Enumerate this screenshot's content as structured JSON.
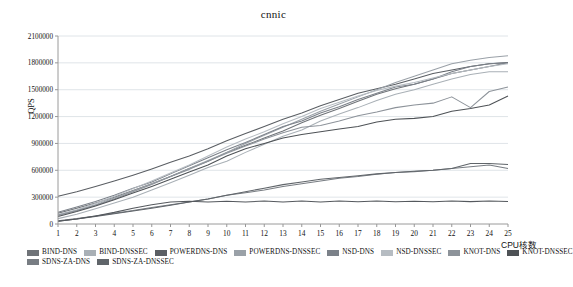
{
  "page": {
    "clipped_header_text": "",
    "background": "#ffffff"
  },
  "chart_data": {
    "type": "line",
    "title": "cnnic",
    "xlabel": "CPU核数",
    "ylabel": "QPS",
    "xlim": [
      1,
      25
    ],
    "ylim": [
      0,
      2100000
    ],
    "ytick_step": 300000,
    "yticks": [
      0,
      300000,
      600000,
      900000,
      1200000,
      1500000,
      1800000,
      2100000
    ],
    "ytick_labels": [
      "0",
      "300000",
      "600000",
      "900000",
      "1200000",
      "1500000",
      "1800000",
      "2100000"
    ],
    "x": [
      1,
      2,
      3,
      4,
      5,
      6,
      7,
      8,
      9,
      10,
      11,
      12,
      13,
      14,
      15,
      16,
      17,
      18,
      19,
      20,
      21,
      22,
      23,
      24,
      25
    ],
    "xtick_labels": [
      "1",
      "2",
      "3",
      "4",
      "5",
      "6",
      "7",
      "8",
      "9",
      "10",
      "11",
      "12",
      "13",
      "14",
      "15",
      "16",
      "17",
      "18",
      "19",
      "20",
      "21",
      "22",
      "23",
      "24",
      "25"
    ],
    "grid": "horizontal",
    "legend_position": "bottom",
    "series": [
      {
        "name": "BIND-DNS",
        "color": "#6f7378",
        "values": [
          120000,
          175000,
          235000,
          300000,
          375000,
          450000,
          530000,
          620000,
          700000,
          800000,
          880000,
          960000,
          1040000,
          1130000,
          1215000,
          1290000,
          1370000,
          1450000,
          1510000,
          1560000,
          1620000,
          1680000,
          1720000,
          1760000,
          1800000
        ]
      },
      {
        "name": "BIND-DNSSEC",
        "color": "#a9b0b6",
        "values": [
          60000,
          110000,
          170000,
          235000,
          300000,
          380000,
          460000,
          545000,
          630000,
          700000,
          800000,
          890000,
          980000,
          1050000,
          1150000,
          1230000,
          1300000,
          1380000,
          1450000,
          1500000,
          1560000,
          1620000,
          1670000,
          1700000,
          1700000
        ]
      },
      {
        "name": "POWERDNS-DNS",
        "color": "#5a5e63",
        "values": [
          310000,
          360000,
          420000,
          480000,
          545000,
          615000,
          690000,
          760000,
          840000,
          930000,
          1010000,
          1090000,
          1170000,
          1240000,
          1320000,
          1390000,
          1460000,
          1510000,
          1560000,
          1620000,
          1680000,
          1720000,
          1760000,
          1790000,
          1805000
        ]
      },
      {
        "name": "POWERDNS-DNSSEC",
        "color": "#9aa1a8",
        "values": [
          95000,
          150000,
          215000,
          290000,
          370000,
          450000,
          530000,
          620000,
          710000,
          800000,
          900000,
          990000,
          1080000,
          1170000,
          1260000,
          1340000,
          1420000,
          1500000,
          1580000,
          1650000,
          1720000,
          1790000,
          1830000,
          1860000,
          1880000
        ]
      },
      {
        "name": "NSD-DNS",
        "color": "#7b8189",
        "values": [
          130000,
          190000,
          250000,
          320000,
          400000,
          470000,
          560000,
          650000,
          740000,
          830000,
          910000,
          1000000,
          1090000,
          1150000,
          1240000,
          1310000,
          1390000,
          1460000,
          1530000,
          1560000,
          1620000,
          1700000,
          1760000,
          1790000,
          1800000
        ]
      },
      {
        "name": "NSD-DNSSEC",
        "color": "#b6bcc2",
        "values": [
          105000,
          160000,
          230000,
          310000,
          395000,
          480000,
          570000,
          660000,
          760000,
          860000,
          950000,
          1030000,
          1120000,
          1200000,
          1290000,
          1360000,
          1430000,
          1490000,
          1540000,
          1580000,
          1630000,
          1680000,
          1720000,
          1760000,
          1790000
        ]
      },
      {
        "name": "KNOT-DNS",
        "color": "#8d939a",
        "values": [
          100000,
          150000,
          210000,
          280000,
          360000,
          440000,
          530000,
          610000,
          700000,
          790000,
          870000,
          950000,
          1020000,
          1080000,
          1100000,
          1150000,
          1210000,
          1250000,
          1300000,
          1330000,
          1350000,
          1420000,
          1300000,
          1480000,
          1530000
        ]
      },
      {
        "name": "KNOT-DNSSEC",
        "color": "#4e5256",
        "values": [
          85000,
          140000,
          200000,
          270000,
          345000,
          420000,
          500000,
          580000,
          660000,
          760000,
          840000,
          900000,
          960000,
          1000000,
          1030000,
          1060000,
          1090000,
          1140000,
          1170000,
          1180000,
          1200000,
          1260000,
          1290000,
          1330000,
          1430000
        ]
      },
      {
        "name": "SDNS-ZA-DNS",
        "color": "#787d83",
        "values": [
          35000,
          60000,
          90000,
          120000,
          150000,
          185000,
          215000,
          245000,
          280000,
          320000,
          350000,
          380000,
          420000,
          450000,
          480000,
          510000,
          530000,
          555000,
          575000,
          585000,
          600000,
          620000,
          640000,
          660000,
          620000
        ]
      },
      {
        "name": "SDNS-ZA-DNSSEC",
        "color": "#60656a",
        "values": [
          30000,
          55000,
          85000,
          115000,
          145000,
          175000,
          210000,
          245000,
          280000,
          320000,
          360000,
          400000,
          440000,
          470000,
          500000,
          520000,
          540000,
          560000,
          575000,
          590000,
          600000,
          620000,
          675000,
          675000,
          665000
        ]
      },
      {
        "name": "SDNS-ZA-DNSSEC-FLAT",
        "color": "#55595e",
        "values": [
          30000,
          55000,
          90000,
          130000,
          175000,
          215000,
          245000,
          255000,
          245000,
          255000,
          245000,
          258000,
          245000,
          258000,
          245000,
          258000,
          248000,
          258000,
          248000,
          255000,
          248000,
          258000,
          250000,
          258000,
          252000
        ]
      }
    ]
  },
  "legend": {
    "rows": [
      [
        {
          "label": "BIND-DNS",
          "color": "#6f7378"
        },
        {
          "label": "BIND-DNSSEC",
          "color": "#a9b0b6"
        },
        {
          "label": "POWERDNS-DNS",
          "color": "#5a5e63"
        },
        {
          "label": "POWERDNS-DNSSEC",
          "color": "#9aa1a8"
        },
        {
          "label": "NSD-DNS",
          "color": "#7b8189"
        },
        {
          "label": "NSD-DNSSEC",
          "color": "#b6bcc2"
        },
        {
          "label": "KNOT-DNS",
          "color": "#8d939a"
        },
        {
          "label": "KNOT-DNSSEC",
          "color": "#4e5256"
        }
      ],
      [
        {
          "label": "SDNS-ZA-DNS",
          "color": "#787d83"
        },
        {
          "label": "SDNS-ZA-DNSSEC",
          "color": "#60656a"
        }
      ]
    ]
  }
}
